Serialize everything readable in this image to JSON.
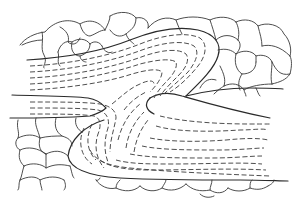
{
  "figure": {
    "colors": {
      "background": "#ffffff",
      "line": "#2a2a2a",
      "caption": "#bdbdbd"
    },
    "caption": ""
  }
}
